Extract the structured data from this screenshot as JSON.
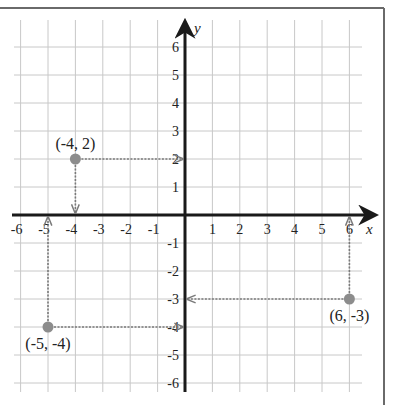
{
  "chart_data": {
    "type": "scatter",
    "title": "",
    "xlabel": "x",
    "ylabel": "y",
    "xlim": [
      -6,
      6
    ],
    "ylim": [
      -6,
      6
    ],
    "grid": true,
    "x_ticks": [
      -6,
      -5,
      -4,
      -3,
      -2,
      -1,
      1,
      2,
      3,
      4,
      5,
      6
    ],
    "y_ticks": [
      6,
      5,
      4,
      3,
      2,
      1,
      -1,
      -2,
      -3,
      -4,
      -5,
      -6
    ],
    "points": [
      {
        "x": -4,
        "y": 2,
        "label": "(-4, 2)"
      },
      {
        "x": -5,
        "y": -4,
        "label": "(-5, -4)"
      },
      {
        "x": 6,
        "y": -3,
        "label": "(6, -3)"
      }
    ],
    "guides": "dotted projection arrows from each point to the x-axis and y-axis"
  },
  "colors": {
    "grid": "#c8c8c8",
    "axis": "#1a1a1a",
    "point": "#8c8c8c",
    "guide": "#7a7a7a",
    "frame": "#6a6a6a",
    "text": "#222222"
  }
}
